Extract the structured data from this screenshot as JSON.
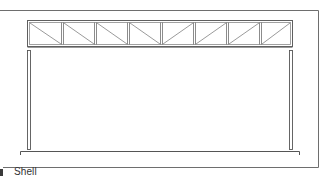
{
  "figure": {
    "caption": "Shell",
    "colors": {
      "line": "#6e6e6e",
      "line_dark": "#555555",
      "diagonal": "#808080",
      "background": "#ffffff",
      "marker": "#3a3a3a"
    },
    "truss": {
      "panel_count": 8,
      "left_diagonal_direction": "down-right",
      "right_diagonal_direction": "up-right"
    },
    "columns": {
      "count": 2
    }
  }
}
